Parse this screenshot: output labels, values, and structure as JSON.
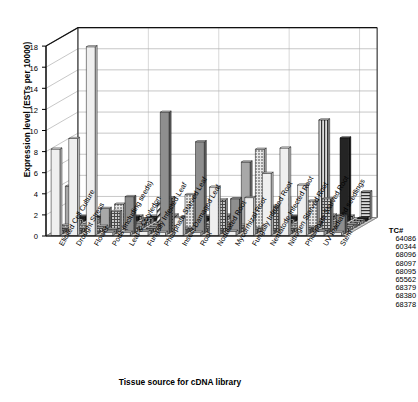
{
  "chart_data": {
    "type": "bar",
    "title": "",
    "xlabel": "Tissue source for cDNA library",
    "ylabel": "Expression level (ESTs per 10000)",
    "ylim": [
      0,
      18
    ],
    "yticks": [
      0,
      2,
      4,
      6,
      8,
      10,
      12,
      14,
      16,
      18
    ],
    "grid": true,
    "three_d": true,
    "legend_title": "TC#",
    "legend_position": "right",
    "categories": [
      "Elicited Cell Culture",
      "Drought Stress",
      "Flower",
      "Pods (including seeds)",
      "Leaf & Cotyledon",
      "Fungally Infected Leaf",
      "Phosphate Starved Leaf",
      "Insect Damaged Leaf",
      "Root",
      "Nodulated Root",
      "Mycorrhizal Root",
      "Fungally Infected Root",
      "Nematode Infected Root",
      "Nitrogen Starved Root",
      "Phosphate Starved Root",
      "UV Irradiated seedlings",
      "Stem"
    ],
    "series": [
      {
        "name": "64086",
        "values": [
          8.2,
          9.2,
          17.9,
          0.3,
          0.3,
          0.4,
          0.3,
          1.7,
          0.3,
          4.6,
          0.4,
          3.6,
          5.9,
          8.3,
          4.8,
          0.4,
          0.3
        ]
      },
      {
        "name": "60344",
        "values": [
          0.3,
          0.3,
          0.0,
          0.4,
          3.5,
          0.3,
          11.5,
          0.4,
          8.7,
          0.3,
          3.3,
          0.4,
          0.3,
          0.3,
          0.4,
          0.3,
          1.7
        ]
      },
      {
        "name": "68096",
        "values": [
          0.3,
          0.3,
          0.3,
          1.9,
          0.4,
          0.3,
          3.2,
          0.3,
          0.3,
          3.0,
          0.4,
          0.3,
          2.4,
          0.3,
          0.4,
          3.1,
          0.3
        ]
      },
      {
        "name": "68097",
        "values": [
          0.4,
          0.4,
          0.3,
          2.4,
          0.3,
          0.3,
          0.4,
          3.3,
          0.3,
          0.3,
          0.4,
          7.6,
          0.3,
          0.4,
          2.7,
          0.3,
          0.3
        ]
      },
      {
        "name": "68095",
        "values": [
          3.9,
          0.3,
          1.8,
          0.3,
          0.4,
          0.3,
          0.3,
          0.4,
          0.3,
          0.3,
          6.2,
          0.3,
          0.4,
          0.3,
          0.3,
          0.4,
          0.3
        ]
      },
      {
        "name": "65562",
        "values": [
          0.3,
          0.3,
          0.3,
          0.4,
          0.3,
          2.1,
          0.3,
          0.3,
          0.4,
          0.3,
          0.3,
          0.4,
          2.6,
          0.3,
          0.4,
          0.3,
          0.3
        ]
      },
      {
        "name": "68379",
        "values": [
          0.3,
          0.4,
          0.3,
          0.3,
          0.4,
          0.3,
          0.3,
          0.4,
          0.3,
          2.3,
          0.3,
          0.4,
          0.3,
          0.3,
          9.8,
          0.4,
          0.3
        ]
      },
      {
        "name": "68380",
        "values": [
          0.4,
          0.3,
          0.3,
          0.4,
          0.3,
          0.3,
          0.4,
          0.3,
          0.3,
          0.4,
          0.3,
          0.3,
          0.4,
          0.3,
          0.3,
          7.9,
          0.3
        ]
      },
      {
        "name": "68378",
        "values": [
          0.3,
          0.3,
          0.4,
          0.3,
          0.3,
          0.4,
          0.3,
          0.3,
          0.4,
          0.3,
          0.3,
          0.4,
          0.3,
          0.3,
          0.4,
          0.3,
          2.6
        ]
      }
    ]
  },
  "legend": {
    "title": "TC#",
    "items": [
      "64086",
      "60344",
      "68096",
      "68097",
      "68095",
      "65562",
      "68379",
      "68380",
      "68378"
    ]
  },
  "axes": {
    "y_title": "Expression level (ESTs per 10000)",
    "x_title": "Tissue source for cDNA library",
    "y_ticks": [
      "18",
      "16",
      "14",
      "12",
      "10",
      "8",
      "6",
      "4",
      "2",
      "0"
    ]
  },
  "colors": {
    "background": "#ffffff",
    "axis": "#000000",
    "grid": "#8c8c8c",
    "floor": "#d0d0d0",
    "bar_light": "#f2f2f2",
    "bar_mid": "#9a9a9a",
    "bar_dark": "#2a2a2a"
  }
}
